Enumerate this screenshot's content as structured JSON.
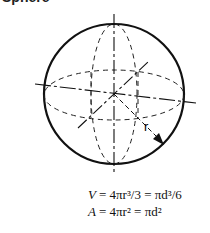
{
  "title": "Sphere",
  "figure": {
    "radius_label": "r"
  },
  "formulas": {
    "volume": {
      "lhs": "V",
      "expr": "= 4πr³/3 = πd³/6"
    },
    "area": {
      "lhs": "A",
      "expr": "= 4πr² = πd²"
    }
  }
}
